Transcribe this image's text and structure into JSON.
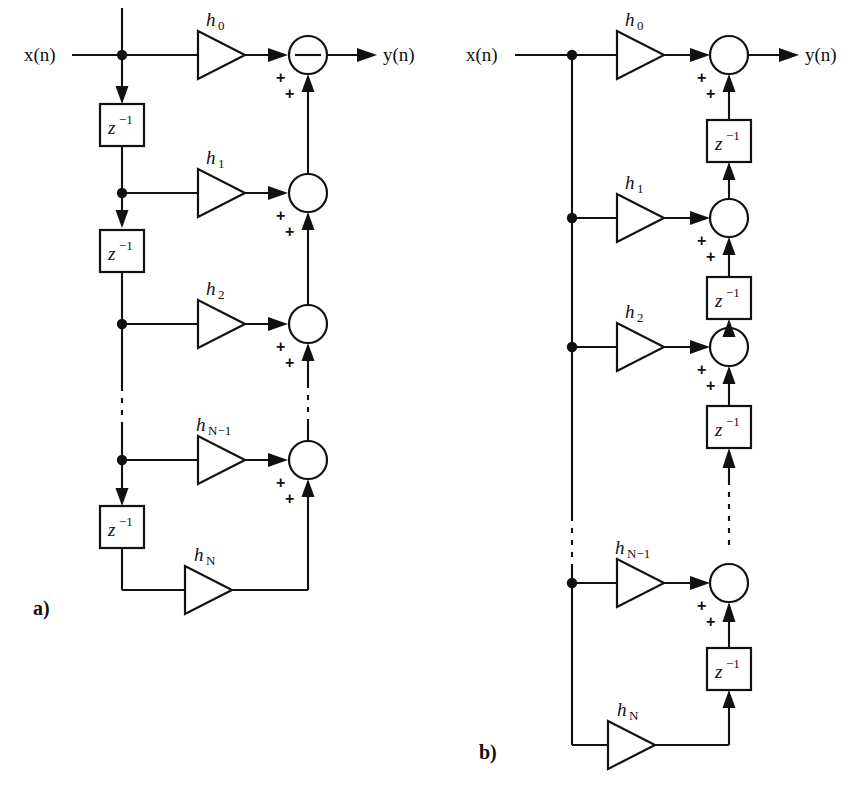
{
  "figure": {
    "kind": "signal-flow-graph",
    "panels": [
      {
        "id": "a",
        "caption": "a)",
        "form": "direct-form",
        "input_label": "x(n)",
        "output_label": "y(n)",
        "coefficients": [
          {
            "base": "h",
            "sub": "0"
          },
          {
            "base": "h",
            "sub": "1"
          },
          {
            "base": "h",
            "sub": "2"
          },
          {
            "base": "h",
            "sub": "N−1"
          },
          {
            "base": "h",
            "sub": "N"
          }
        ],
        "delay_label": {
          "base": "z",
          "sup": "−1"
        },
        "delay_count_shown": 3,
        "adder_signs": [
          "+",
          "+"
        ],
        "adders_shown": 4,
        "ellipsis": "vertical-dashed"
      },
      {
        "id": "b",
        "caption": "b)",
        "form": "transposed-direct-form",
        "input_label": "x(n)",
        "output_label": "y(n)",
        "coefficients": [
          {
            "base": "h",
            "sub": "0"
          },
          {
            "base": "h",
            "sub": "1"
          },
          {
            "base": "h",
            "sub": "2"
          },
          {
            "base": "h",
            "sub": "N−1"
          },
          {
            "base": "h",
            "sub": "N"
          }
        ],
        "delay_label": {
          "base": "z",
          "sup": "−1"
        },
        "delay_count_shown": 4,
        "adder_signs": [
          "+",
          "+"
        ],
        "adders_shown": 4,
        "ellipsis": "vertical-dashed"
      }
    ],
    "colors": {
      "ink": "#111111",
      "paper": "#ffffff"
    }
  }
}
